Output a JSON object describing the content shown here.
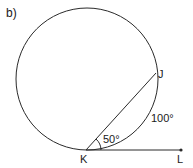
{
  "figure_label": "b)",
  "points": {
    "J": "J",
    "K": "K",
    "L": "L"
  },
  "angles": {
    "inscribed_tangent_angle": "50°"
  },
  "arcs": {
    "arc_KJ": "100°"
  },
  "colors": {
    "stroke": "#2a2a2a"
  }
}
